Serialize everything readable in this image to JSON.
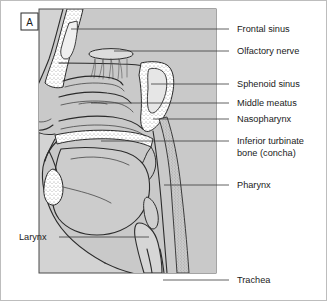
{
  "figure": {
    "panel_letter": "A",
    "caption_subject": "sagittal section of the upper respiratory tract",
    "panel_color": "#d3d3d3",
    "tissue_color": "#c9c9c9",
    "cavity_color": "#efefef",
    "line_color": "#2b2b2b",
    "background_color": "#ffffff",
    "border_color": "#bdbdbd"
  },
  "labels_right": [
    {
      "id": "frontal-sinus",
      "text": "Frontal sinus",
      "x": 236,
      "y": 31,
      "leader": {
        "x1": 228,
        "y1": 28,
        "x2": 70,
        "y2": 28
      }
    },
    {
      "id": "olfactory-nerve",
      "text": "Olfactory nerve",
      "x": 236,
      "y": 53,
      "leader": {
        "x1": 228,
        "y1": 50,
        "x2": 113,
        "y2": 50
      }
    },
    {
      "id": "sphenoid-sinus",
      "text": "Sphenoid sinus",
      "x": 236,
      "y": 86,
      "leader": {
        "x1": 228,
        "y1": 83,
        "x2": 150,
        "y2": 83
      }
    },
    {
      "id": "middle-meatus",
      "text": "Middle meatus",
      "x": 236,
      "y": 105,
      "leader": {
        "x1": 228,
        "y1": 102,
        "x2": 90,
        "y2": 102
      }
    },
    {
      "id": "nasopharynx",
      "text": "Nasopharynx",
      "x": 236,
      "y": 121,
      "leader": {
        "x1": 228,
        "y1": 118,
        "x2": 152,
        "y2": 118
      }
    },
    {
      "id": "inferior-turbinate",
      "text": "Inferior turbinate",
      "x": 236,
      "y": 143,
      "leader": {
        "x1": 228,
        "y1": 140,
        "x2": 100,
        "y2": 140
      }
    },
    {
      "id": "inferior-turbinate-line2",
      "text": "bone (concha)",
      "x": 236,
      "y": 155,
      "leader": null
    },
    {
      "id": "pharynx",
      "text": "Pharynx",
      "x": 236,
      "y": 187,
      "leader": {
        "x1": 228,
        "y1": 184,
        "x2": 163,
        "y2": 184
      }
    },
    {
      "id": "trachea",
      "text": "Trachea",
      "x": 236,
      "y": 282,
      "leader": {
        "x1": 228,
        "y1": 279,
        "x2": 162,
        "y2": 279
      }
    }
  ],
  "labels_left": [
    {
      "id": "larynx",
      "text": "Larynx",
      "x": 18,
      "y": 239,
      "leader": {
        "x1": 58,
        "y1": 236,
        "x2": 148,
        "y2": 236
      }
    }
  ]
}
